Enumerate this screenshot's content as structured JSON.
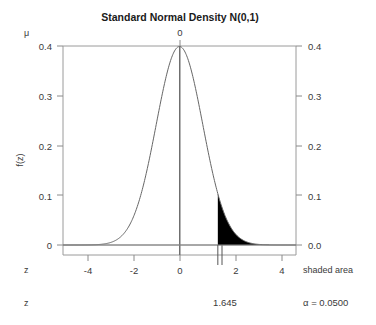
{
  "chart_data": {
    "type": "area",
    "title": "Standard Normal Density N(0,1)",
    "xlabel": "z",
    "ylabel": "f(z)",
    "xlim": [
      -5.0,
      5.0
    ],
    "ylim": [
      0.0,
      0.43
    ],
    "grid": false,
    "legend": "none",
    "distribution": {
      "name": "standard normal",
      "mean": 0,
      "sd": 1,
      "peak_density": 0.3989
    },
    "x_axis": {
      "label": "z",
      "ticks": [
        -4,
        -2,
        0,
        2,
        4
      ],
      "tick_labels": [
        "-4",
        "-2",
        "0",
        "2",
        "4"
      ],
      "extra_tick_value": 1.645,
      "extra_tick_label": "1.645"
    },
    "y_axis_left": {
      "label": "f(z)",
      "ticks": [
        0,
        0.1,
        0.2,
        0.3,
        0.4
      ],
      "tick_labels": [
        "0",
        "0.1",
        "0.2",
        "0.3",
        "0.4"
      ]
    },
    "y_axis_right": {
      "label": "shaded area",
      "ticks": [
        0.0,
        0.1,
        0.2,
        0.3,
        0.4
      ],
      "tick_labels": [
        "0.0",
        "0.1",
        "0.2",
        "0.3",
        "0.4"
      ]
    },
    "top_axis": {
      "label": "μ",
      "ticks": [
        0
      ],
      "tick_labels": [
        "0"
      ]
    },
    "shaded_region": {
      "from": 1.645,
      "to": 5.0,
      "tail": "right",
      "area": 0.05,
      "area_label": "α = 0.0500",
      "boundary_label": "1.645",
      "fill_color": "#000000"
    },
    "annotations": {
      "bottom_left_axis_label": "z",
      "bottom_right_area_label": "α = 0.0500",
      "critical_value_label": "1.645",
      "right_axis_caption": "shaded area",
      "top_axis_caption": "μ"
    },
    "curve_points": [
      {
        "z": -5.0,
        "f": 0.0
      },
      {
        "z": -4.5,
        "f": 0.0
      },
      {
        "z": -4.0,
        "f": 0.0001
      },
      {
        "z": -3.5,
        "f": 0.0009
      },
      {
        "z": -3.0,
        "f": 0.0044
      },
      {
        "z": -2.5,
        "f": 0.0175
      },
      {
        "z": -2.0,
        "f": 0.054
      },
      {
        "z": -1.645,
        "f": 0.1031
      },
      {
        "z": -1.5,
        "f": 0.1295
      },
      {
        "z": -1.0,
        "f": 0.242
      },
      {
        "z": -0.5,
        "f": 0.3521
      },
      {
        "z": 0.0,
        "f": 0.3989
      },
      {
        "z": 0.5,
        "f": 0.3521
      },
      {
        "z": 1.0,
        "f": 0.242
      },
      {
        "z": 1.5,
        "f": 0.1295
      },
      {
        "z": 1.645,
        "f": 0.1031
      },
      {
        "z": 2.0,
        "f": 0.054
      },
      {
        "z": 2.5,
        "f": 0.0175
      },
      {
        "z": 3.0,
        "f": 0.0044
      },
      {
        "z": 3.5,
        "f": 0.0009
      },
      {
        "z": 4.0,
        "f": 0.0001
      },
      {
        "z": 4.5,
        "f": 0.0
      },
      {
        "z": 5.0,
        "f": 0.0
      }
    ]
  },
  "style": {
    "curve_color": "#666666",
    "axis_color": "#8a8a8a",
    "frame_color": "#9a9a9a",
    "text_color": "#3a3a3a",
    "title_color": "#1a1a1a",
    "fill_color": "#000000",
    "background": "#ffffff"
  }
}
